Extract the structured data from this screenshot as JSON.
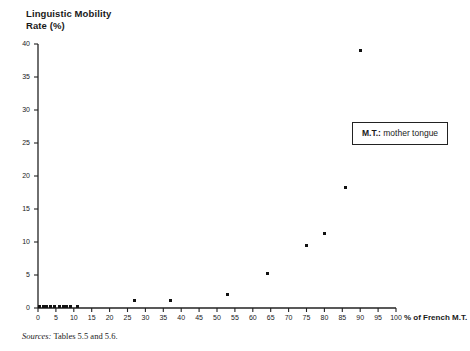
{
  "chart_data": {
    "type": "scatter",
    "title": "Linguistic Mobility\nRate (%)",
    "xlabel": "% of French M.T.",
    "ylabel": "Linguistic Mobility Rate (%)",
    "xlim": [
      0,
      100
    ],
    "ylim": [
      0,
      40
    ],
    "xticks": [
      0,
      5,
      10,
      15,
      20,
      25,
      30,
      35,
      40,
      45,
      50,
      55,
      60,
      65,
      70,
      75,
      80,
      85,
      90,
      95,
      100
    ],
    "yticks": [
      0,
      5,
      10,
      15,
      20,
      25,
      30,
      35,
      40
    ],
    "grid": false,
    "legend_position": "right-upper",
    "points": [
      {
        "x": 0.5,
        "y": 0.3
      },
      {
        "x": 1.5,
        "y": 0.3
      },
      {
        "x": 2.5,
        "y": 0.3
      },
      {
        "x": 3.5,
        "y": 0.3
      },
      {
        "x": 4.5,
        "y": 0.3
      },
      {
        "x": 6.0,
        "y": 0.3
      },
      {
        "x": 7.0,
        "y": 0.3
      },
      {
        "x": 8.0,
        "y": 0.3
      },
      {
        "x": 9.0,
        "y": 0.3
      },
      {
        "x": 11.0,
        "y": 0.3
      },
      {
        "x": 27.0,
        "y": 1.2
      },
      {
        "x": 37.0,
        "y": 1.2
      },
      {
        "x": 53.0,
        "y": 2.1
      },
      {
        "x": 64.0,
        "y": 5.3
      },
      {
        "x": 75.0,
        "y": 9.5
      },
      {
        "x": 80.0,
        "y": 11.3
      },
      {
        "x": 86.0,
        "y": 18.2
      },
      {
        "x": 90.0,
        "y": 39.0
      }
    ],
    "marker_color": "#111111",
    "axis_color": "#222222"
  },
  "legend": {
    "abbr": "M.T.:",
    "expansion": "mother tongue"
  },
  "source": {
    "label": "Sources:",
    "text": "Tables 5.5 and 5.6."
  }
}
